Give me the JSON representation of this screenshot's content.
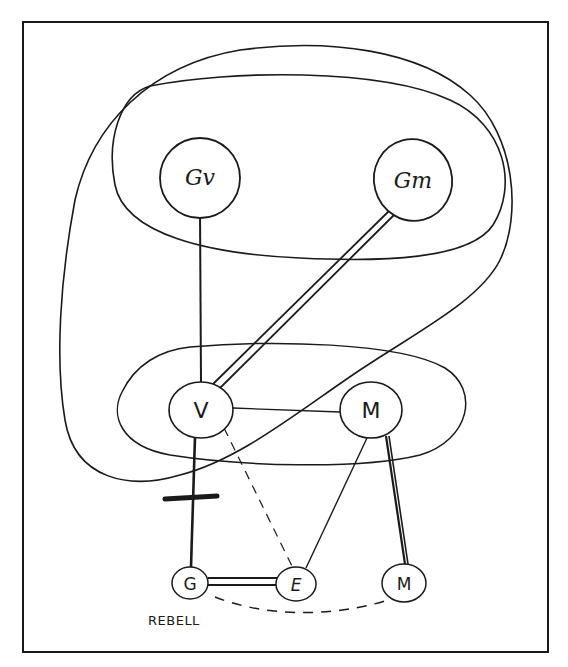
{
  "diagram": {
    "type": "hand-drawn network diagram",
    "frame": {
      "stroke": "#1a1a1a"
    },
    "nodes": [
      {
        "id": "Gv",
        "label": "Gv",
        "x": 200,
        "y": 178,
        "rx": 40,
        "ry": 40
      },
      {
        "id": "Gm",
        "label": "Gm",
        "x": 413,
        "y": 180,
        "rx": 39,
        "ry": 41
      },
      {
        "id": "V",
        "label": "V",
        "x": 201,
        "y": 410,
        "rx": 32,
        "ry": 28
      },
      {
        "id": "M1",
        "label": "M",
        "x": 371,
        "y": 410,
        "rx": 32,
        "ry": 28
      },
      {
        "id": "G",
        "label": "G",
        "x": 190,
        "y": 583,
        "rx": 18,
        "ry": 16
      },
      {
        "id": "E",
        "label": "E",
        "x": 296,
        "y": 584,
        "rx": 20,
        "ry": 17
      },
      {
        "id": "M2",
        "label": "M",
        "x": 404,
        "y": 583,
        "rx": 22,
        "ry": 19
      }
    ],
    "edges": [
      {
        "from": "Gv",
        "to": "V",
        "style": "solid"
      },
      {
        "from": "Gm",
        "to": "V",
        "style": "double"
      },
      {
        "from": "V",
        "to": "M1",
        "style": "solid-thin"
      },
      {
        "from": "V",
        "to": "G",
        "style": "solid-thick",
        "marker": "crossbar"
      },
      {
        "from": "V",
        "to": "E",
        "style": "dashed"
      },
      {
        "from": "M1",
        "to": "E",
        "style": "solid-thin"
      },
      {
        "from": "M1",
        "to": "M2",
        "style": "double-thick"
      },
      {
        "from": "G",
        "to": "E",
        "style": "double"
      },
      {
        "from": "G",
        "to": "M2",
        "style": "dashed-curve"
      }
    ],
    "groups": [
      {
        "id": "top-group",
        "contains": [
          "Gv",
          "Gm"
        ]
      },
      {
        "id": "middle-group",
        "contains": [
          "V",
          "M1"
        ]
      },
      {
        "id": "outer-loop",
        "contains": [
          "Gv",
          "Gm",
          "V"
        ]
      }
    ],
    "captions": {
      "rebel": "REBELL"
    }
  }
}
